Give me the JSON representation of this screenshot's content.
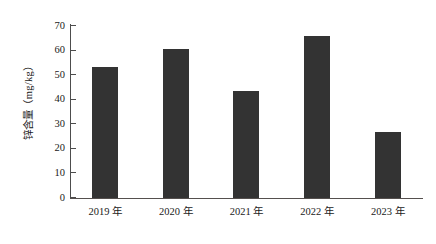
{
  "chart_data": {
    "type": "bar",
    "title": "",
    "xlabel": "",
    "ylabel": "锌含量（mg/kg）",
    "categories": [
      "2019 年",
      "2020 年",
      "2021 年",
      "2022 年",
      "2023 年"
    ],
    "values": [
      53.5,
      60.6,
      43.5,
      66.0,
      27.0
    ],
    "ylim": [
      0,
      70
    ],
    "yticks": [
      0,
      10,
      20,
      30,
      40,
      50,
      60,
      70
    ],
    "ytick_labels": [
      "0",
      "10",
      "20",
      "30",
      "40",
      "50",
      "60",
      "70"
    ],
    "grid": false,
    "legend": null,
    "bar_color": "#333333",
    "axis_color": "#4d4d4d"
  }
}
